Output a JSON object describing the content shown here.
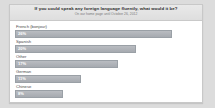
{
  "poll": {
    "title": "If you could speak any foreign language fluently, what would it be?",
    "subtitle": "On our home page until October 26, 2012",
    "accent_color": "#a6aab0",
    "header_color": "#e4e4e4",
    "panel_color": "#ffffff",
    "page_background": "#dcdcdc"
  },
  "chart_data": {
    "type": "bar",
    "orientation": "horizontal",
    "title": "If you could speak any foreign language fluently, what would it be?",
    "subtitle": "On our home page until October 26, 2012",
    "xlabel": "",
    "ylabel": "",
    "xlim": [
      0,
      100
    ],
    "grid": false,
    "legend": null,
    "categories": [
      "French (bonjour)",
      "Spanish",
      "Other",
      "German",
      "Chinese"
    ],
    "values": [
      26,
      20,
      17,
      11,
      8
    ],
    "value_labels": [
      "26%",
      "20%",
      "17%",
      "11%",
      "8%"
    ],
    "bars": [
      {
        "label": "French (bonjour)",
        "value": 26,
        "value_label": "26%"
      },
      {
        "label": "Spanish",
        "value": 20,
        "value_label": "20%"
      },
      {
        "label": "Other",
        "value": 17,
        "value_label": "17%"
      },
      {
        "label": "German",
        "value": 11,
        "value_label": "11%"
      },
      {
        "label": "Chinese",
        "value": 8,
        "value_label": "8%"
      }
    ]
  }
}
